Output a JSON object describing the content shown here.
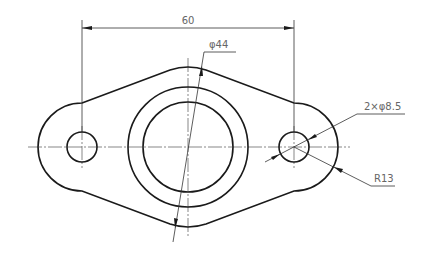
{
  "drawing": {
    "type": "engineering-drawing",
    "subject": "flange plate with two mounting holes",
    "colors": {
      "outline": "#1a1a1a",
      "dimension_text": "#666666",
      "centerline": "#555555",
      "background": "#ffffff"
    },
    "dimensions": {
      "hole_spacing": {
        "label": "60"
      },
      "boss_diameter": {
        "label": "φ44"
      },
      "holes": {
        "label": "2×φ8.5"
      },
      "ear_radius": {
        "label": "R13"
      }
    }
  }
}
